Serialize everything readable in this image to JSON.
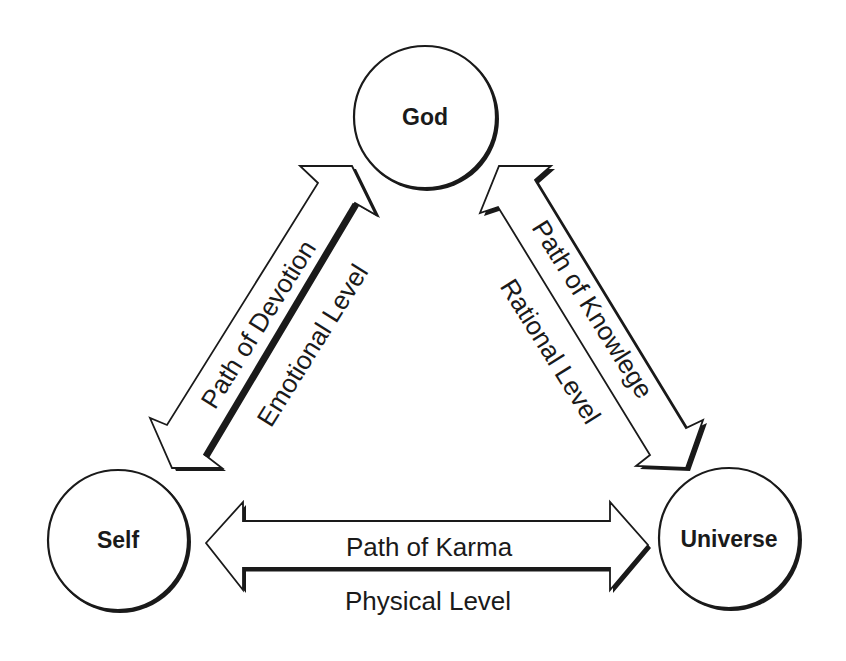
{
  "diagram": {
    "type": "triangle-relationship",
    "nodes": [
      {
        "id": "god",
        "label": "God",
        "cx": 425,
        "cy": 117,
        "r": 72
      },
      {
        "id": "self",
        "label": "Self",
        "cx": 118,
        "cy": 540,
        "r": 71
      },
      {
        "id": "universe",
        "label": "Universe",
        "cx": 729,
        "cy": 538,
        "r": 71
      }
    ],
    "edges": [
      {
        "id": "devotion",
        "from": "self",
        "to": "god",
        "path_label": "Path of Devotion",
        "level_label": "Emotional Level",
        "direction": "bidirectional"
      },
      {
        "id": "knowledge",
        "from": "god",
        "to": "universe",
        "path_label": "Path of Knowlege",
        "level_label": "Rational Level",
        "direction": "bidirectional"
      },
      {
        "id": "karma",
        "from": "self",
        "to": "universe",
        "path_label": "Path of Karma",
        "level_label": "Physical Level",
        "direction": "bidirectional"
      }
    ]
  },
  "colors": {
    "stroke": "#1a1a1a",
    "fill": "#ffffff",
    "background": "#ffffff"
  }
}
